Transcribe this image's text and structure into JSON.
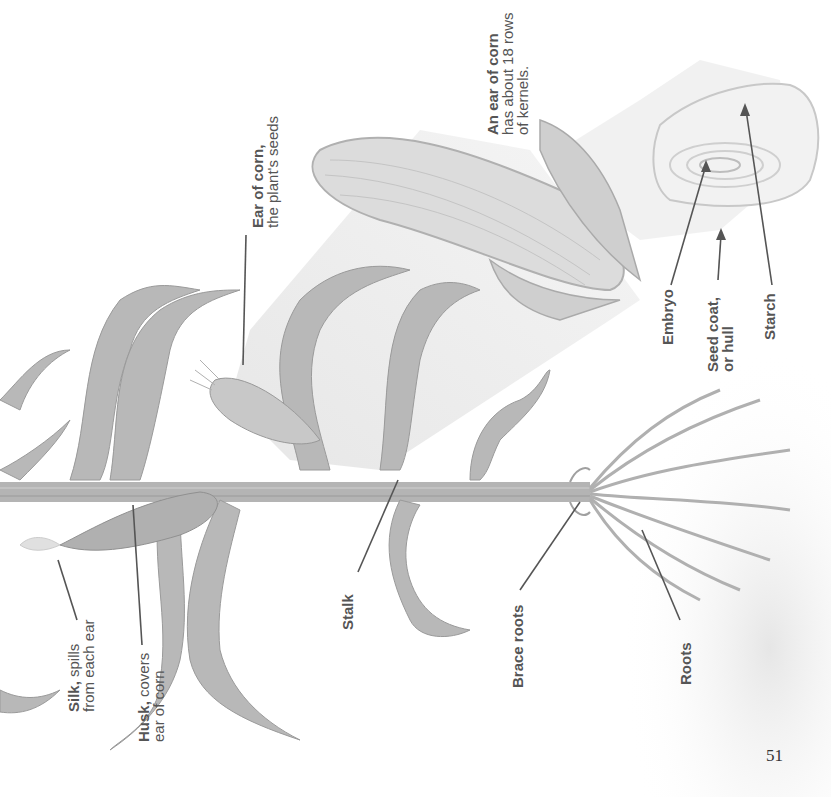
{
  "diagram": {
    "orientation": "rotated 90 degrees counter-clockwise",
    "labels": {
      "ear_of_corn": {
        "title": "Ear of corn,",
        "desc": "the plant's seeds"
      },
      "ear_rows": {
        "title": "An ear of corn",
        "desc_line1": "has about 18 rows",
        "desc_line2": "of kernels."
      },
      "embryo": {
        "title": "Embryo"
      },
      "seed_coat": {
        "title": "Seed coat,",
        "desc": "or hull"
      },
      "starch": {
        "title": "Starch"
      },
      "silk": {
        "title": "Silk,",
        "desc_line1": " spills",
        "desc_line2": "from each ear"
      },
      "husk": {
        "title": "Husk,",
        "desc_line1": " covers",
        "desc_line2": "ear of corn"
      },
      "stalk": {
        "title": "Stalk"
      },
      "brace_roots": {
        "title": "Brace roots"
      },
      "roots": {
        "title": "Roots"
      }
    },
    "colors": {
      "plant": "#a8a8a8",
      "plant_dark": "#8a8a8a",
      "leader_line": "#555555",
      "label_text": "#555555",
      "soil": "#ececec",
      "magnify_cone": "#efefef"
    }
  },
  "page": {
    "number": "51"
  }
}
